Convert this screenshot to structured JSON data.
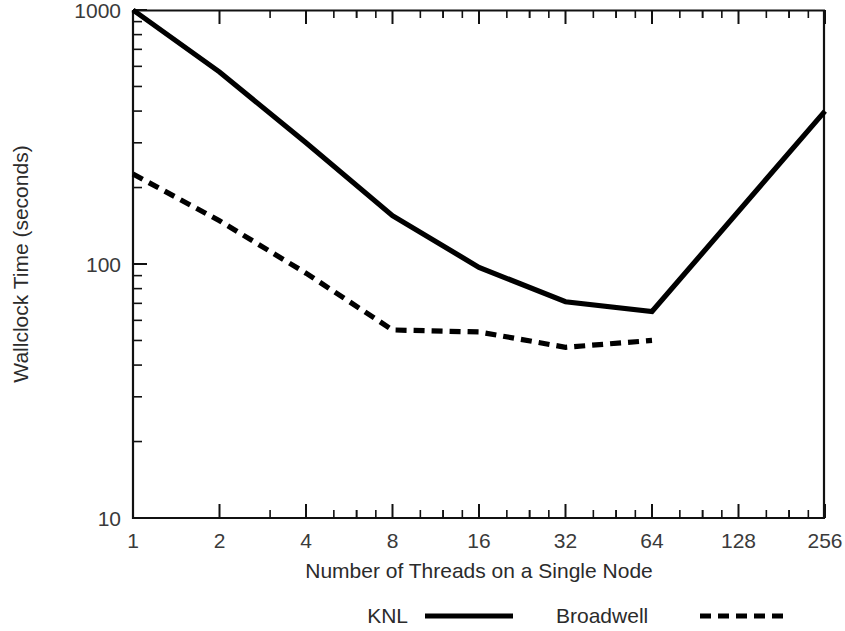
{
  "chart_data": {
    "type": "line",
    "title": "",
    "xlabel": "Number of Threads on a Single Node",
    "ylabel": "Wallclock Time (seconds)",
    "xscale": "log2",
    "yscale": "log10",
    "xlim": [
      1,
      256
    ],
    "ylim": [
      10,
      1000
    ],
    "grid": false,
    "legend_position": "below-plot",
    "xticks": [
      1,
      2,
      4,
      8,
      16,
      32,
      64,
      128,
      256
    ],
    "xtick_labels": [
      "1",
      "2",
      "4",
      "8",
      "16",
      "32",
      "64",
      "128",
      "256"
    ],
    "yticks": [
      10,
      100,
      1000
    ],
    "ytick_labels": [
      "10",
      "100",
      "1000"
    ],
    "series": [
      {
        "name": "KNL",
        "style": "solid",
        "x": [
          1,
          2,
          4,
          8,
          16,
          32,
          64,
          256
        ],
        "values": [
          1000,
          570,
          300,
          155,
          97,
          71,
          65,
          400
        ]
      },
      {
        "name": "Broadwell",
        "style": "dashed",
        "x": [
          1,
          2,
          4,
          8,
          16,
          32,
          64
        ],
        "values": [
          226,
          148,
          92,
          55,
          54,
          47,
          50
        ]
      }
    ]
  },
  "legend": {
    "items": [
      {
        "label": "KNL",
        "style": "solid"
      },
      {
        "label": "Broadwell",
        "style": "dashed"
      }
    ]
  },
  "colors": {
    "line": "#000000",
    "axis": "#111111",
    "text": "#2b2b2b",
    "background": "#ffffff"
  }
}
